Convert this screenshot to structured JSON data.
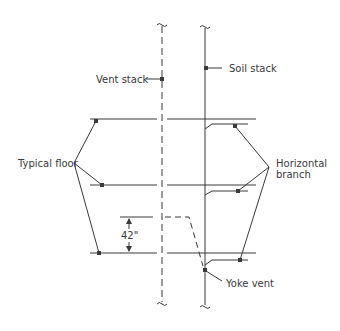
{
  "diagram": {
    "type": "plumbing-vent-riser",
    "labels": {
      "vent_stack": "Vent stack",
      "soil_stack": "Soil stack",
      "typical_floor": "Typical floor",
      "horizontal_branch_line1": "Horizontal",
      "horizontal_branch_line2": "branch",
      "dimension": "42\"",
      "yoke_vent": "Yoke vent"
    },
    "colors": {
      "line": "#3a3a3a",
      "text": "#3a3a3a",
      "background": "#ffffff"
    }
  }
}
